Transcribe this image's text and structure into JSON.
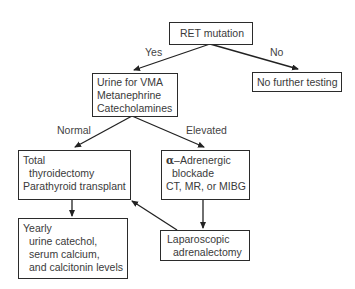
{
  "diagram": {
    "type": "flowchart",
    "nodes": {
      "ret": {
        "lines": [
          "RET mutation"
        ]
      },
      "urine": {
        "lines": [
          "Urine for VMA",
          "Metanephrine",
          "Catecholamines"
        ]
      },
      "no_test": {
        "lines": [
          "No further testing"
        ]
      },
      "thyroid": {
        "lines": [
          "Total",
          "thyroidectomy",
          "Parathyroid transplant"
        ]
      },
      "alpha": {
        "symbol": "α",
        "lines": [
          "–Adrenergic",
          "blockade",
          "CT, MR, or MIBG"
        ]
      },
      "yearly": {
        "lines": [
          "Yearly",
          "urine catechol,",
          "serum calcium,",
          "and calcitonin levels"
        ]
      },
      "lap": {
        "lines": [
          "Laparoscopic",
          "adrenalectomy"
        ]
      }
    },
    "edge_labels": {
      "yes": "Yes",
      "no": "No",
      "normal": "Normal",
      "elevated": "Elevated"
    },
    "edges": [
      {
        "from": "ret",
        "to": "urine",
        "label": "Yes"
      },
      {
        "from": "ret",
        "to": "no_test",
        "label": "No"
      },
      {
        "from": "urine",
        "to": "thyroid",
        "label": "Normal"
      },
      {
        "from": "urine",
        "to": "alpha",
        "label": "Elevated"
      },
      {
        "from": "thyroid",
        "to": "yearly"
      },
      {
        "from": "alpha",
        "to": "lap"
      },
      {
        "from": "lap",
        "to": "thyroid"
      }
    ]
  }
}
